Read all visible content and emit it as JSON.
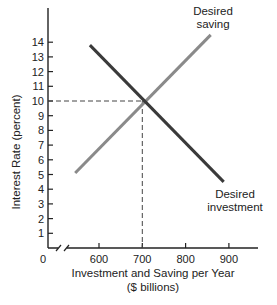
{
  "chart_data": {
    "type": "line",
    "title": "",
    "xlabel": "Investment and Saving per Year",
    "xlabel_unit": "($ billions)",
    "ylabel": "Interest Rate (percent)",
    "x_ticks": [
      600,
      700,
      800,
      900
    ],
    "y_ticks": [
      1,
      2,
      3,
      4,
      5,
      6,
      7,
      8,
      9,
      10,
      11,
      12,
      13,
      14
    ],
    "origin_label": "0",
    "x_axis_break": true,
    "xlim": [
      500,
      1000
    ],
    "ylim": [
      0,
      16
    ],
    "grid": false,
    "legend": "none (curves labeled directly)",
    "series": [
      {
        "name": "Desired saving",
        "label_lines": [
          "Desired",
          "saving"
        ],
        "color": "#8a8a8a",
        "x": [
          545,
          858
        ],
        "y": [
          5.1,
          14.5
        ]
      },
      {
        "name": "Desired investment",
        "label_lines": [
          "Desired",
          "investment"
        ],
        "color": "#3a3a3a",
        "x": [
          579,
          888
        ],
        "y": [
          13.8,
          4.5
        ]
      }
    ],
    "annotations": [
      {
        "type": "equilibrium",
        "x": 700,
        "y": 10,
        "style": "dashed guide lines to both axes"
      }
    ]
  }
}
